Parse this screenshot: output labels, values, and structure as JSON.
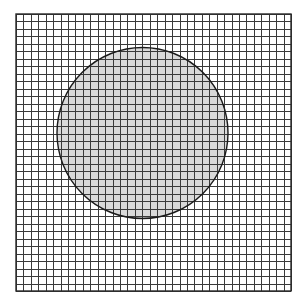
{
  "canvas": {
    "width": 307,
    "height": 308,
    "background_color": "#ffffff",
    "title": "Square grid overlaid with shaded circle"
  },
  "chart_data": {
    "type": "scatter",
    "subtitle": "",
    "xlabel": "",
    "ylabel": "",
    "grid": true,
    "legend": false,
    "legend_position": "none",
    "xlim": [
      0,
      37
    ],
    "ylim": [
      0,
      37
    ],
    "tick_labels_x": [],
    "tick_labels_y": [],
    "annotations": [],
    "series": [
      {
        "name": "grid",
        "kind": "grid-mesh",
        "cell_count_x": 37,
        "cell_count_y": 37,
        "cell_size_px": 7.43,
        "line_color": "#3a3a3a",
        "line_width_px": 1.25
      },
      {
        "name": "circle",
        "kind": "shape",
        "shape": "circle",
        "center_x_px": 142.5,
        "center_y_px": 133.0,
        "radius_px": 85.5,
        "radius_cells": 11.5,
        "fill_color": "#d9d9d9",
        "stroke_color": "#1a1a1a",
        "stroke_width_px": 1.4,
        "area_cells_approx": 415
      }
    ]
  },
  "grid": {
    "origin_x": 16,
    "origin_y": 14,
    "end_x": 291,
    "end_y": 291,
    "width": 275,
    "height": 277,
    "columns": 37,
    "rows": 37,
    "line_color": "#3a3a3a",
    "line_width": 1.25,
    "border_color": "#2a2a2a",
    "border_width": 1.4,
    "cell_fill_outside": "#ffffff",
    "cell_fill_inside": "#d9d9d9"
  },
  "circle": {
    "center_x": 142.5,
    "center_y": 133.0,
    "radius": 85.5,
    "fill": "#d9d9d9",
    "stroke": "#1a1a1a",
    "stroke_width": 1.4,
    "label": "shaded-circle"
  }
}
